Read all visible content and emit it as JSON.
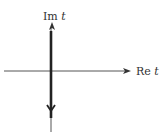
{
  "diagram": {
    "axes": {
      "imaginary": {
        "label_prefix": "Im",
        "label_var": "t"
      },
      "real": {
        "label_prefix": "Re",
        "label_var": "t"
      }
    },
    "contour": {
      "direction": "downward",
      "description": "vertical contour along imaginary axis"
    },
    "colors": {
      "axis": "#555555",
      "contour": "#222222",
      "text": "#333333"
    }
  }
}
